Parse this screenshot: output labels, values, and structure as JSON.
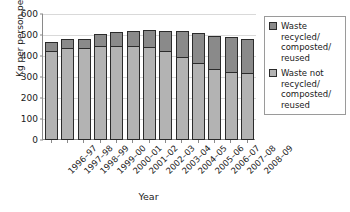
{
  "chart_data": {
    "type": "bar",
    "stacked": true,
    "title": "",
    "xlabel": "Year",
    "ylabel": "Kg per person per year",
    "ylim": [
      0,
      600
    ],
    "yticks": [
      0,
      100,
      200,
      300,
      400,
      500,
      600
    ],
    "grid": true,
    "legend_position": "right",
    "categories": [
      "1996–97",
      "1997–98",
      "1998–99",
      "1999–00",
      "2000–01",
      "2001–02",
      "2002–03",
      "2003–04",
      "2004–05",
      "2005–06",
      "2006–07",
      "2007–08",
      "2008–09"
    ],
    "series": [
      {
        "name": "Waste not recycled/composted/reused",
        "color": "#b3b3b3",
        "values": [
          425,
          440,
          440,
          450,
          450,
          450,
          445,
          425,
          395,
          365,
          340,
          325,
          320
        ]
      },
      {
        "name": "Waste recycled/composted/reused",
        "color": "#8a8a8a",
        "values": [
          40,
          40,
          43,
          55,
          63,
          70,
          77,
          95,
          125,
          145,
          155,
          165,
          160
        ]
      }
    ],
    "totals": [
      465,
      480,
      483,
      505,
      513,
      520,
      522,
      520,
      520,
      510,
      495,
      490,
      480
    ]
  },
  "axes": {
    "ylabel": "Kg per person per year",
    "xlabel": "Year",
    "ytick_labels": [
      "0",
      "100",
      "200",
      "300",
      "400",
      "500",
      "600"
    ]
  },
  "legend": {
    "entries": [
      {
        "label": "Waste recycled/ composted/ reused",
        "color": "#8a8a8a"
      },
      {
        "label": "Waste not recycled/ composted/ reused",
        "color": "#b3b3b3"
      }
    ]
  }
}
